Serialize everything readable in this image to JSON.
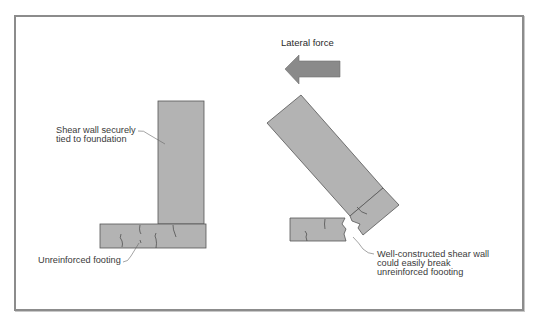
{
  "diagram": {
    "title": "Lateral force",
    "colors": {
      "wall_fill": "#b3b3b3",
      "outline": "#555555",
      "arrow_fill": "#8a8a8a",
      "frame": "#8c8c8c",
      "leader": "#666666"
    },
    "left_scene": {
      "wall_label": [
        "Shear wall securely",
        "tied to foundation"
      ],
      "footing_label": "Unreinforced footing"
    },
    "right_scene": {
      "break_label": [
        "Well-constructed shear wall",
        "could easily break",
        "unreinforced foooting"
      ]
    },
    "icons": {
      "force_arrow": "left-arrow-icon"
    }
  }
}
